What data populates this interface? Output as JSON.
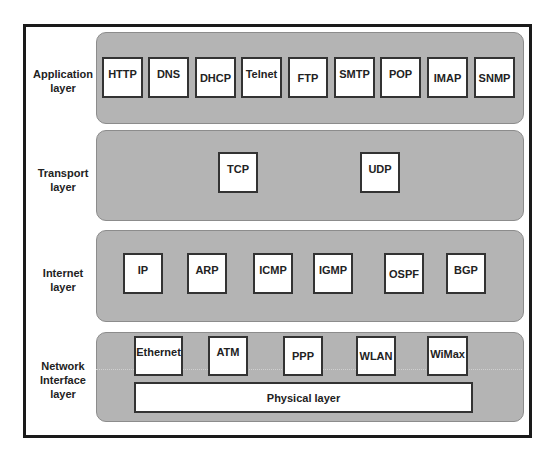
{
  "diagram": {
    "layers": [
      {
        "name": "application",
        "label": "Application\nlayer",
        "protocols": [
          "HTTP",
          "DNS",
          "DHCP",
          "Telnet",
          "FTP",
          "SMTP",
          "POP",
          "IMAP",
          "SNMP"
        ]
      },
      {
        "name": "transport",
        "label": "Transport\nlayer",
        "protocols": [
          "TCP",
          "UDP"
        ]
      },
      {
        "name": "internet",
        "label": "Internet\nlayer",
        "protocols": [
          "IP",
          "ARP",
          "ICMP",
          "IGMP",
          "OSPF",
          "BGP"
        ]
      },
      {
        "name": "network-interface",
        "label": "Network\nInterface\nlayer",
        "protocols": [
          "Ethernet",
          "ATM",
          "PPP",
          "WLAN",
          "WiMax"
        ],
        "sublayer": "Physical layer"
      }
    ]
  },
  "colors": {
    "panel_fill": "#b4b4b4",
    "box_fill": "#ffffff",
    "border": "#1a1a1a"
  }
}
